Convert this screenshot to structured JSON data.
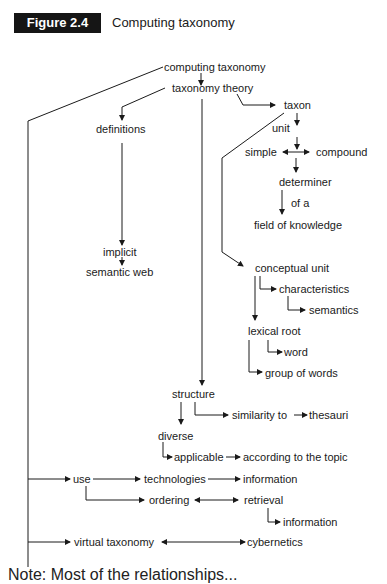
{
  "figure": {
    "label": "Figure 2.4",
    "title": "Computing taxonomy",
    "label_bg": "#151515",
    "label_fg": "#ffffff"
  },
  "nodes": {
    "computing_taxonomy": "computing taxonomy",
    "taxonomy_theory": "taxonomy theory",
    "taxon": "taxon",
    "definitions": "definitions",
    "unit": "unit",
    "simple": "simple",
    "compound": "compound",
    "determiner": "determiner",
    "of_a": "of a",
    "field_of_knowledge": "field of knowledge",
    "implicit": "implicit",
    "semantic_web": "semantic web",
    "conceptual_unit": "conceptual unit",
    "characteristics": "characteristics",
    "semantics": "semantics",
    "lexical_root": "lexical root",
    "word": "word",
    "group_of_words": "group of words",
    "structure": "structure",
    "similarity_to": "similarity to",
    "thesauri": "thesauri",
    "diverse": "diverse",
    "applicable": "applicable",
    "according_to_the_topic": "according to the topic",
    "use": "use",
    "technologies": "technologies",
    "information_1": "information",
    "ordering": "ordering",
    "retrieval": "retrieval",
    "information_2": "information",
    "virtual_taxonomy": "virtual taxonomy",
    "cybernetics": "cybernetics"
  },
  "footer_partial": "Note: Most of the relationships..."
}
